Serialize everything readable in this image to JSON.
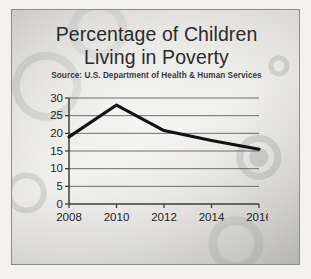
{
  "slide": {
    "title_lines": [
      "Percentage of Children",
      "Living in Poverty"
    ],
    "source": "Source: U.S. Department of Health & Human Services",
    "frame_color": "#8c8c8c",
    "background_color": "#e3e2df"
  },
  "chart_data": {
    "type": "line",
    "title": "Percentage of Children Living in Poverty",
    "subtitle": "Source: U.S. Department of Health & Human Services",
    "xlabel": "",
    "ylabel": "",
    "categories": [
      "2008",
      "2010",
      "2012",
      "2014",
      "2016"
    ],
    "x": [
      2008,
      2010,
      2012,
      2014,
      2016
    ],
    "values": [
      19,
      28,
      20.8,
      18,
      15.5
    ],
    "series": [
      {
        "name": "Percentage of children living in poverty",
        "values": [
          19,
          28,
          20.8,
          18,
          15.5
        ],
        "color": "#121212"
      }
    ],
    "xlim": [
      2008,
      2016
    ],
    "ylim": [
      0,
      30
    ],
    "ytick_labels": [
      "0",
      "5",
      "10",
      "15",
      "20",
      "25",
      "30"
    ],
    "yticks": [
      0,
      5,
      10,
      15,
      20,
      25,
      30
    ],
    "xtick_labels": [
      "2008",
      "2010",
      "2012",
      "2014",
      "2016"
    ],
    "grid": "horizontal",
    "legend": "none",
    "line_color": "#121212",
    "axis_color": "#3d3d3d",
    "gridline_color": "#5f5f5f"
  }
}
